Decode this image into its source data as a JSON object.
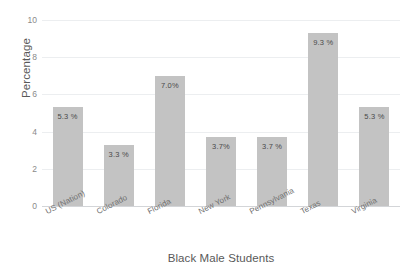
{
  "chart_data": {
    "type": "bar",
    "title": "",
    "xlabel": "Black Male Students",
    "ylabel": "Percentage",
    "categories": [
      "US (Nation)",
      "Colorado",
      "Florida",
      "New York",
      "Pennsylvania",
      "Texas",
      "Virginia"
    ],
    "values": [
      5.3,
      3.3,
      7.0,
      3.7,
      3.7,
      9.3,
      5.3
    ],
    "value_labels": [
      "5.3 %",
      "3.3 %",
      "7.0%",
      "3.7%",
      "3.7 %",
      "9.3 %",
      "5.3 %"
    ],
    "ylim": [
      0,
      10
    ],
    "yticks": [
      0,
      2,
      4,
      6,
      8,
      10
    ],
    "ytick_labels": [
      "0",
      "2",
      "4",
      "6",
      "8",
      "10"
    ],
    "grid": true,
    "legend": false,
    "legend_position": "none",
    "bar_color": "#c3c3c3",
    "grid_color": "#eceef0",
    "axis_color": "#d3d5d8",
    "text_color": "#595959"
  }
}
